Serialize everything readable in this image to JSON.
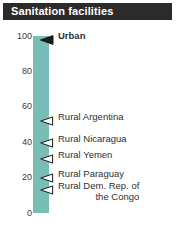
{
  "header": {
    "title": "Sanitation facilities"
  },
  "chart_data": {
    "type": "bar",
    "title": "Sanitation facilities",
    "xlabel": "",
    "ylabel": "",
    "ylim": [
      0,
      100
    ],
    "ytick_labels": [
      "100",
      "80",
      "60",
      "40",
      "20",
      "0"
    ],
    "ytick_values": [
      100,
      80,
      60,
      40,
      20,
      0
    ],
    "grid": false,
    "legend": "none",
    "bar_color": "#79bdb7",
    "categories": [
      "Urban",
      "Rural Argentina",
      "Rural Nicaragua",
      "Rural Yemen",
      "Rural Paraguay",
      "Rural Dem. Rep. of the Congo"
    ],
    "values": [
      100,
      54,
      42,
      33,
      22,
      15
    ],
    "annotations": [
      {
        "label": "Urban",
        "label_line1": "Urban",
        "label_line2": "",
        "value": 100,
        "marker": "filled-left-triangle",
        "marker_icon": "solid-triangle-left-icon",
        "bold": true
      },
      {
        "label": "Rural Argentina",
        "label_line1": "Rural Argentina",
        "label_line2": "",
        "value": 54,
        "marker": "hollow-left-triangle",
        "marker_icon": "hollow-triangle-left-icon",
        "bold": false
      },
      {
        "label": "Rural Nicaragua",
        "label_line1": "Rural Nicaragua",
        "label_line2": "",
        "value": 42,
        "marker": "hollow-left-triangle",
        "marker_icon": "hollow-triangle-left-icon",
        "bold": false
      },
      {
        "label": "Rural Yemen",
        "label_line1": "Rural Yemen",
        "label_line2": "",
        "value": 33,
        "marker": "hollow-left-triangle",
        "marker_icon": "hollow-triangle-left-icon",
        "bold": false
      },
      {
        "label": "Rural Paraguay",
        "label_line1": "Rural Paraguay",
        "label_line2": "",
        "value": 22,
        "marker": "hollow-left-triangle",
        "marker_icon": "hollow-triangle-left-icon",
        "bold": false
      },
      {
        "label": "Rural Dem. Rep. of the Congo",
        "label_line1": "Rural Dem. Rep. of",
        "label_line2": "the Congo",
        "value": 15,
        "marker": "hollow-left-triangle",
        "marker_icon": "hollow-triangle-left-icon",
        "bold": false
      }
    ]
  }
}
